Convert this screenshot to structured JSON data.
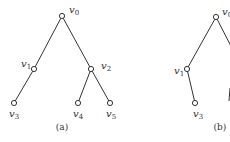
{
  "figure": {
    "panels": [
      {
        "id": "a",
        "caption": "(a)",
        "nodes": [
          {
            "id": "v0",
            "name": "v",
            "sub": "0",
            "x": 62,
            "y": 16,
            "lx": 69,
            "ly": 13
          },
          {
            "id": "v1",
            "name": "v",
            "sub": "1",
            "x": 34,
            "y": 69,
            "lx": 21,
            "ly": 67
          },
          {
            "id": "v2",
            "name": "v",
            "sub": "2",
            "x": 91,
            "y": 69,
            "lx": 101,
            "ly": 69
          },
          {
            "id": "v3",
            "name": "v",
            "sub": "3",
            "x": 14,
            "y": 103,
            "lx": 9,
            "ly": 117
          },
          {
            "id": "v4",
            "name": "v",
            "sub": "4",
            "x": 78,
            "y": 103,
            "lx": 73,
            "ly": 117
          },
          {
            "id": "v5",
            "name": "v",
            "sub": "5",
            "x": 110,
            "y": 103,
            "lx": 106,
            "ly": 117
          }
        ],
        "edges": [
          [
            "v0",
            "v1"
          ],
          [
            "v0",
            "v2"
          ],
          [
            "v1",
            "v3"
          ],
          [
            "v2",
            "v4"
          ],
          [
            "v2",
            "v5"
          ]
        ]
      },
      {
        "id": "b",
        "caption": "(b)",
        "nodes": [
          {
            "id": "v0",
            "name": "v",
            "sub": "0",
            "x": 216,
            "y": 17,
            "lx": 222,
            "ly": 15
          },
          {
            "id": "v1",
            "name": "v",
            "sub": "1",
            "x": 187,
            "y": 69,
            "lx": 174,
            "ly": 74
          },
          {
            "id": "v3",
            "name": "v",
            "sub": "3",
            "x": 195,
            "y": 103,
            "lx": 194,
            "ly": 117
          }
        ],
        "edges": [
          [
            "v0",
            "v1"
          ],
          [
            "v1",
            "v3"
          ]
        ]
      }
    ]
  }
}
